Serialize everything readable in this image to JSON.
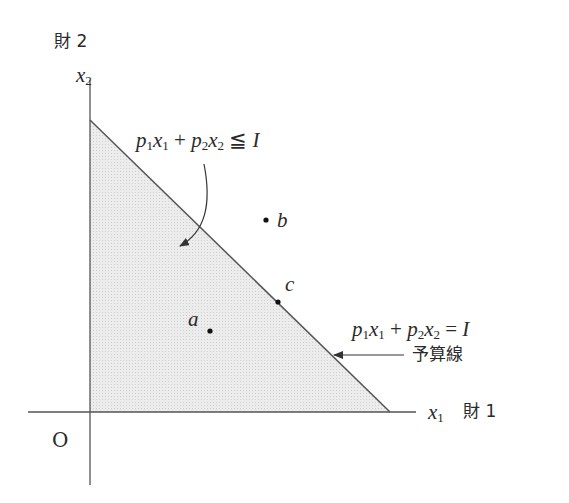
{
  "diagram": {
    "y_axis_label_text": "財 2",
    "y_axis_var": "x",
    "y_axis_var_sub": "2",
    "x_axis_var": "x",
    "x_axis_var_sub": "1",
    "x_axis_label_text": "財 1",
    "origin_label": "O",
    "inequality": {
      "p1": "p",
      "p1_sub": "1",
      "x1": "x",
      "x1_sub": "1",
      "plus": "+",
      "p2": "p",
      "p2_sub": "2",
      "x2": "x",
      "x2_sub": "2",
      "rel": "≦",
      "rhs": "I"
    },
    "equation": {
      "p1": "p",
      "p1_sub": "1",
      "x1": "x",
      "x1_sub": "1",
      "plus": "+",
      "p2": "p",
      "p2_sub": "2",
      "x2": "x",
      "x2_sub": "2",
      "rel": "=",
      "rhs": "I"
    },
    "budget_line_label": "予算線",
    "points": [
      {
        "label": "a",
        "x": 210,
        "y": 331
      },
      {
        "label": "b",
        "x": 266,
        "y": 220
      },
      {
        "label": "c",
        "x": 278,
        "y": 302
      }
    ],
    "colors": {
      "axis": "#555555",
      "budget_line": "#555555",
      "feasible_fill": "#e6e6e6"
    }
  }
}
